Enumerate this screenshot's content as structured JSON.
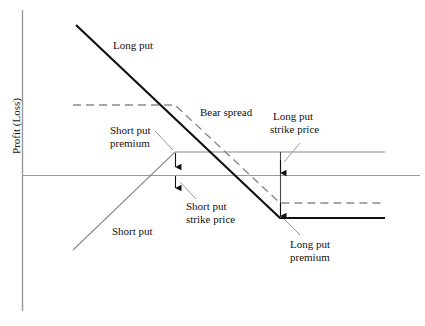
{
  "figure": {
    "axis_label_y": "Profit (Loss)",
    "background_color": "#ffffff",
    "line_color_solid_dark": "#111111",
    "line_color_gray": "#8a8a8a",
    "axis_color": "#9a9a9a"
  },
  "labels": {
    "long_put": "Long put",
    "short_put": "Short put",
    "bear_spread": "Bear spread",
    "short_put_premium_l1": "Short put",
    "short_put_premium_l2": "premium",
    "short_put_strike_l1": "Short put",
    "short_put_strike_l2": "strike price",
    "long_put_strike_l1": "Long put",
    "long_put_strike_l2": "strike price",
    "long_put_premium_l1": "Long put",
    "long_put_premium_l2": "premium"
  },
  "chart_data": {
    "type": "line",
    "title": "",
    "xlabel": "",
    "ylabel": "Profit (Loss)",
    "xlim": [
      22,
      420
    ],
    "ylim": [
      310,
      10
    ],
    "grid": false,
    "legend": "inline-annotations",
    "zero_line_y": 175,
    "axis_origin_x": 22,
    "series": [
      {
        "name": "Long put",
        "style": "solid",
        "width": 2.2,
        "color": "#111111",
        "points": [
          [
            76,
            25
          ],
          [
            280,
            218
          ],
          [
            385,
            218
          ]
        ],
        "description": "Long put payoff: downward sloping then flat at maximum loss equal to premium paid"
      },
      {
        "name": "Short put",
        "style": "solid",
        "width": 1.1,
        "color": "#8a8a8a",
        "points": [
          [
            73,
            250
          ],
          [
            175,
            152
          ],
          [
            385,
            152
          ]
        ],
        "description": "Short put payoff: upward sloping then flat at maximum gain equal to premium received"
      },
      {
        "name": "Bear spread",
        "style": "dashed",
        "width": 1.4,
        "color": "#8a8a8a",
        "points": [
          [
            73,
            105
          ],
          [
            175,
            105
          ],
          [
            280,
            203
          ],
          [
            385,
            203
          ]
        ],
        "description": "Net bear put spread: flat maximum profit, sloping region between strikes, flat maximum loss"
      }
    ],
    "markers": [
      {
        "name": "short-put-strike-price",
        "x": 175,
        "y": 175,
        "kind": "strike"
      },
      {
        "name": "long-put-strike-price",
        "x": 280,
        "y": 175,
        "kind": "strike"
      },
      {
        "name": "short-put-premium",
        "x": 175,
        "y_top": 152,
        "y_bottom": 175,
        "kind": "premium-span"
      },
      {
        "name": "long-put-premium",
        "x": 280,
        "y_top": 175,
        "y_bottom": 218,
        "kind": "premium-span"
      }
    ],
    "connector_vertical": {
      "x": 280,
      "y_from": 152,
      "y_to": 218
    }
  }
}
